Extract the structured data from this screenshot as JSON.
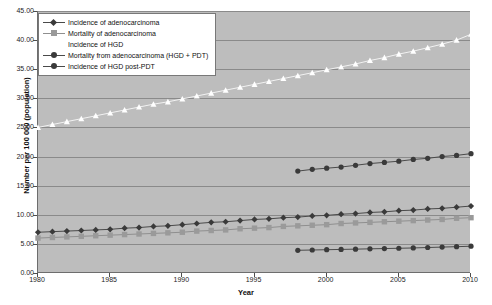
{
  "chart_data": {
    "type": "line",
    "title": "",
    "xlabel": "Year",
    "ylabel": "Number per 100 000 (population)",
    "xlim": [
      1980,
      2010
    ],
    "ylim": [
      0,
      45
    ],
    "ytick_step": 5,
    "xtick_step": 5,
    "grid": "horizontal",
    "legend_position": "top-left",
    "yticks": [
      "0.00",
      "5.00",
      "10.00",
      "15.00",
      "20.00",
      "25.00",
      "30.00",
      "35.00",
      "40.00",
      "45.00"
    ],
    "xticks": [
      "1980",
      "1985",
      "1990",
      "1995",
      "2000",
      "2005",
      "2010"
    ],
    "x": [
      1980,
      1981,
      1982,
      1983,
      1984,
      1985,
      1986,
      1987,
      1988,
      1989,
      1990,
      1991,
      1992,
      1993,
      1994,
      1995,
      1996,
      1997,
      1998,
      1999,
      2000,
      2001,
      2002,
      2003,
      2004,
      2005,
      2006,
      2007,
      2008,
      2009,
      2010
    ],
    "series": [
      {
        "name": "Incidence of adenocarcinoma",
        "marker": "diamond",
        "color": "#3a3a3a",
        "line_color": "#4a4a4a",
        "x": [
          1980,
          1981,
          1982,
          1983,
          1984,
          1985,
          1986,
          1987,
          1988,
          1989,
          1990,
          1991,
          1992,
          1993,
          1994,
          1995,
          1996,
          1997,
          1998,
          1999,
          2000,
          2001,
          2002,
          2003,
          2004,
          2005,
          2006,
          2007,
          2008,
          2009,
          2010
        ],
        "values": [
          7.0,
          7.1,
          7.2,
          7.3,
          7.4,
          7.5,
          7.7,
          7.8,
          8.0,
          8.1,
          8.3,
          8.5,
          8.7,
          8.8,
          9.0,
          9.2,
          9.3,
          9.5,
          9.6,
          9.8,
          9.9,
          10.1,
          10.2,
          10.4,
          10.5,
          10.7,
          10.8,
          11.0,
          11.1,
          11.3,
          11.5
        ]
      },
      {
        "name": "Mortality of adenocarcinoma",
        "marker": "square",
        "color": "#9a9a9a",
        "line_color": "#8f8f8f",
        "x": [
          1980,
          1981,
          1982,
          1983,
          1984,
          1985,
          1986,
          1987,
          1988,
          1989,
          1990,
          1991,
          1992,
          1993,
          1994,
          1995,
          1996,
          1997,
          1998,
          1999,
          2000,
          2001,
          2002,
          2003,
          2004,
          2005,
          2006,
          2007,
          2008,
          2009,
          2010
        ],
        "values": [
          6.0,
          6.1,
          6.2,
          6.3,
          6.4,
          6.5,
          6.6,
          6.7,
          6.8,
          6.9,
          7.0,
          7.2,
          7.3,
          7.4,
          7.6,
          7.7,
          7.8,
          8.0,
          8.1,
          8.2,
          8.3,
          8.5,
          8.6,
          8.7,
          8.8,
          8.9,
          9.0,
          9.1,
          9.2,
          9.4,
          9.5
        ]
      },
      {
        "name": "Incidence of HGD",
        "marker": "triangle",
        "color": "#ffffff",
        "line_color": "#f2f2f2",
        "x": [
          1980,
          1981,
          1982,
          1983,
          1984,
          1985,
          1986,
          1987,
          1988,
          1989,
          1990,
          1991,
          1992,
          1993,
          1994,
          1995,
          1996,
          1997,
          1998,
          1999,
          2000,
          2001,
          2002,
          2003,
          2004,
          2005,
          2006,
          2007,
          2008,
          2009,
          2010
        ],
        "values": [
          25.0,
          25.5,
          26.0,
          26.5,
          27.0,
          27.5,
          28.0,
          28.5,
          29.0,
          29.4,
          29.9,
          30.4,
          30.9,
          31.4,
          31.9,
          32.4,
          32.9,
          33.4,
          33.9,
          34.4,
          34.9,
          35.4,
          35.9,
          36.5,
          37.0,
          37.6,
          38.1,
          38.7,
          39.3,
          40.0,
          41.0
        ]
      },
      {
        "name": "Mortality from adenocarcinoma (HGD + PDT)",
        "marker": "circle",
        "color": "#3a3a3a",
        "line_color": "#4a4a4a",
        "x": [
          1998,
          1999,
          2000,
          2001,
          2002,
          2003,
          2004,
          2005,
          2006,
          2007,
          2008,
          2009,
          2010
        ],
        "values": [
          17.5,
          17.8,
          18.0,
          18.2,
          18.5,
          18.8,
          19.0,
          19.2,
          19.5,
          19.7,
          20.0,
          20.2,
          20.5
        ]
      },
      {
        "name": "Incidence of HGD post-PDT",
        "marker": "circle",
        "color": "#3a3a3a",
        "line_color": "#4a4a4a",
        "x": [
          1998,
          1999,
          2000,
          2001,
          2002,
          2003,
          2004,
          2005,
          2006,
          2007,
          2008,
          2009,
          2010
        ],
        "values": [
          3.9,
          3.95,
          4.0,
          4.05,
          4.1,
          4.15,
          4.2,
          4.25,
          4.3,
          4.38,
          4.45,
          4.52,
          4.6
        ]
      }
    ]
  },
  "legend": {
    "items": [
      {
        "label": "Incidence of adenocarcinoma"
      },
      {
        "label": "Mortality of adenocarcinoma"
      },
      {
        "label": "Incidence of HGD"
      },
      {
        "label": "Mortality from adenocarcinoma (HGD + PDT)"
      },
      {
        "label": "Incidence of HGD post-PDT"
      }
    ]
  }
}
